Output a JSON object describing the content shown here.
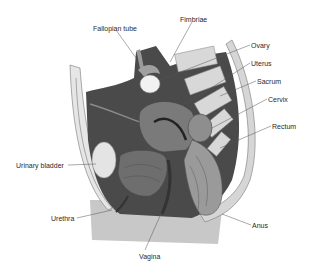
{
  "diagram": {
    "labels": [
      {
        "id": "fallopian-tube",
        "text": "Fallopian tube",
        "x": 93,
        "y": 25
      },
      {
        "id": "fimbriae",
        "text": "Fimbriae",
        "x": 180,
        "y": 16
      },
      {
        "id": "ovary",
        "text": "Ovary",
        "x": 251,
        "y": 42
      },
      {
        "id": "uterus",
        "text": "Uterus",
        "x": 251,
        "y": 60
      },
      {
        "id": "sacrum",
        "text": "Sacrum",
        "x": 257,
        "y": 78
      },
      {
        "id": "cervix",
        "text": "Cervix",
        "x": 268,
        "y": 96
      },
      {
        "id": "rectum",
        "text": "Rectum",
        "x": 272,
        "y": 123
      },
      {
        "id": "urinary-bladder",
        "text": "Urinary bladder",
        "x": 16,
        "y": 162
      },
      {
        "id": "urethra",
        "text": "Urethra",
        "x": 51,
        "y": 215
      },
      {
        "id": "anus",
        "text": "Anus",
        "x": 252,
        "y": 222
      },
      {
        "id": "vagina",
        "text": "Vagina",
        "x": 139,
        "y": 253
      }
    ],
    "colors": {
      "cavity": "#4a4a4a",
      "tissue_light": "#bdbdbd",
      "tissue_mid": "#8a8a8a",
      "bone": "#d8d8d8",
      "skin": "#c8c8c8",
      "line": "#555555",
      "text": "#2a2a2a"
    }
  }
}
